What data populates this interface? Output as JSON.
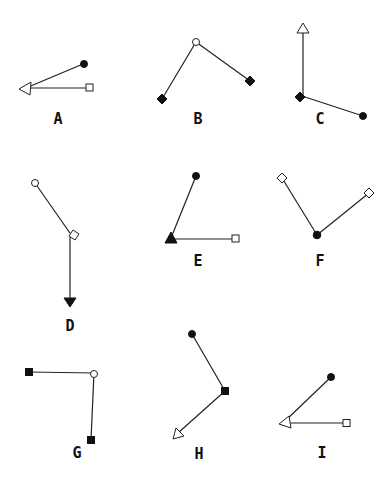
{
  "figures": [
    {
      "label": "A",
      "description": "arrow with open triangle tip at left, two lines from filled circle and open square"
    },
    {
      "label": "B",
      "description": "open circle vertex with two lines to filled diamonds"
    },
    {
      "label": "C",
      "description": "filled diamond vertex, vertical line to open triangle, line to filled circle"
    },
    {
      "label": "D",
      "description": "open circle to open diamond, then vertical line down to filled arrowhead"
    },
    {
      "label": "E",
      "description": "filled triangle vertex with lines to filled circle and open square"
    },
    {
      "label": "F",
      "description": "filled circle vertex with lines to two open diamonds"
    },
    {
      "label": "G",
      "description": "open circle vertex with lines to two filled squares"
    },
    {
      "label": "H",
      "description": "filled square vertex with line to filled circle and line to open triangle arrowhead"
    },
    {
      "label": "I",
      "description": "open triangle vertex with lines to filled circle and open square"
    }
  ],
  "labels": {
    "a": "A",
    "b": "B",
    "c": "C",
    "d": "D",
    "e": "E",
    "f": "F",
    "g": "G",
    "h": "H",
    "i": "I"
  }
}
